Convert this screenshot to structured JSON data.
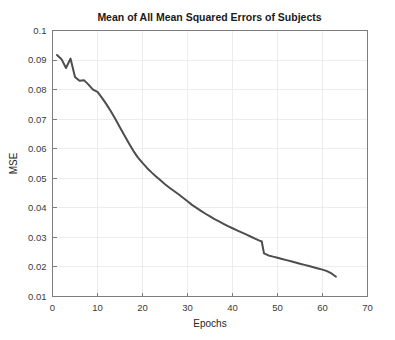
{
  "chart_data": {
    "type": "line",
    "title": "Mean of All Mean Squared Errors of Subjects",
    "xlabel": "Epochs",
    "ylabel": "MSE",
    "xlim": [
      0,
      70
    ],
    "ylim": [
      0.01,
      0.1
    ],
    "grid": true,
    "legend": null,
    "xticks": [
      0,
      10,
      20,
      30,
      40,
      50,
      60,
      70
    ],
    "xticklabels": [
      "0",
      "10",
      "20",
      "30",
      "40",
      "50",
      "60",
      "70"
    ],
    "yticks": [
      0.01,
      0.02,
      0.03,
      0.04,
      0.05,
      0.06,
      0.07,
      0.08,
      0.09,
      0.1
    ],
    "yticklabels": [
      "0.01",
      "0.02",
      "0.03",
      "0.04",
      "0.05",
      "0.06",
      "0.07",
      "0.08",
      "0.09",
      "0.1"
    ],
    "line_color": "#4d4d4d",
    "line_width": 2,
    "series": [
      {
        "name": "Mean MSE",
        "x": [
          1,
          2,
          3,
          4,
          5,
          6,
          7,
          8,
          9,
          10,
          11,
          12,
          13,
          14,
          15,
          16,
          17,
          18,
          19,
          20,
          21,
          22,
          23,
          24,
          25,
          26,
          27,
          28,
          29,
          30,
          31,
          32,
          33,
          34,
          35,
          36,
          37,
          38,
          39,
          40,
          41,
          42,
          43,
          44,
          45,
          46,
          46.5,
          47,
          48,
          49,
          50,
          51,
          52,
          53,
          54,
          55,
          56,
          57,
          58,
          59,
          60,
          61,
          62,
          63
        ],
        "y": [
          0.0917,
          0.0903,
          0.0873,
          0.0905,
          0.0843,
          0.083,
          0.0832,
          0.0817,
          0.08,
          0.0792,
          0.0772,
          0.075,
          0.0726,
          0.07,
          0.0672,
          0.0645,
          0.0618,
          0.0592,
          0.057,
          0.0552,
          0.0535,
          0.052,
          0.0506,
          0.0493,
          0.048,
          0.0468,
          0.0457,
          0.0446,
          0.0434,
          0.0422,
          0.041,
          0.04,
          0.039,
          0.038,
          0.0371,
          0.0362,
          0.0354,
          0.0346,
          0.0338,
          0.0331,
          0.0324,
          0.0317,
          0.031,
          0.0303,
          0.0296,
          0.0289,
          0.0286,
          0.0246,
          0.0239,
          0.0235,
          0.0231,
          0.0227,
          0.0223,
          0.0219,
          0.0215,
          0.0211,
          0.0207,
          0.0203,
          0.0199,
          0.0195,
          0.0191,
          0.0186,
          0.0178,
          0.0167
        ]
      }
    ]
  }
}
